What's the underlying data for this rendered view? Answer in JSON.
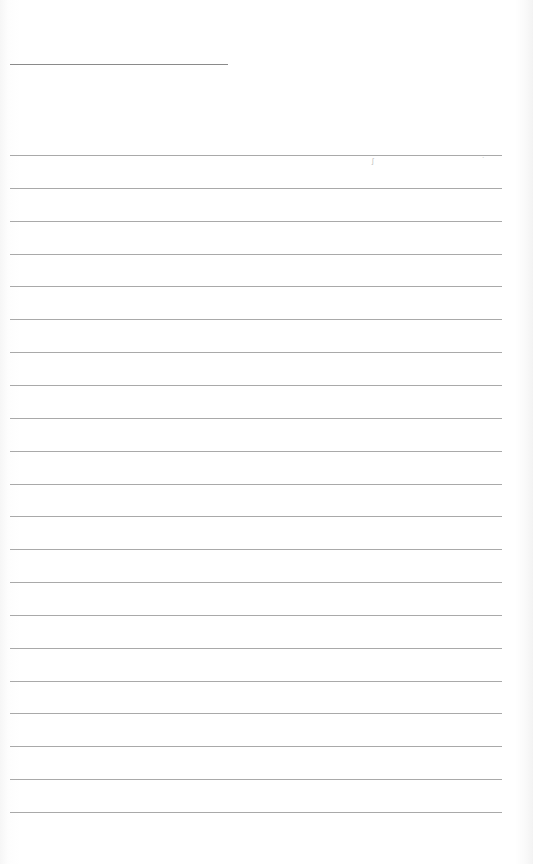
{
  "page": {
    "type": "lined-notebook-page",
    "background_color": "#ffffff",
    "rule_color": "#a9a9a9",
    "title_line": {
      "x": 10,
      "y": 64,
      "width": 218
    },
    "rules": {
      "count": 21,
      "first_y": 155,
      "spacing": 32.85,
      "x": 10,
      "width": 492
    }
  }
}
